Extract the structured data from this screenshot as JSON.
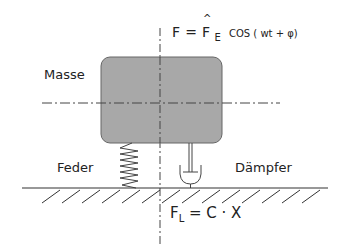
{
  "diagram": {
    "labels": {
      "mass": "Masse",
      "spring": "Feder",
      "damper": "Dämpfer"
    },
    "excitation_force": {
      "lhs": "F",
      "eq": "=",
      "amp": "F",
      "hat": "^",
      "sub": "E",
      "rest": "COS ( wt + φ)"
    },
    "spring_force": {
      "lhs": "F",
      "sub": "L",
      "rest": "= C · X"
    },
    "colors": {
      "mass_fill": "#a8a8a8",
      "mass_stroke": "#666666",
      "line": "#333333"
    }
  }
}
